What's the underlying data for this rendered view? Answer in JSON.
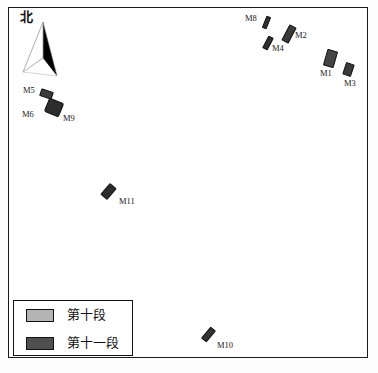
{
  "map": {
    "title": "段董土墓葬分布图",
    "north_label": "北",
    "north_icon": "north-arrow-icon",
    "frame_color": "#1a1a1a",
    "background_color": "#ffffff"
  },
  "legend": {
    "items": [
      {
        "label": "第十段",
        "color": "#b4b4b4",
        "phase": 10
      },
      {
        "label": "第十一段",
        "color": "#4f4f4f",
        "phase": 11
      }
    ]
  },
  "tombs": [
    {
      "id": "M8",
      "label": "M8",
      "color": "#2e2e2e",
      "x": 264,
      "y": 16,
      "w": 5,
      "h": 13,
      "rot": 22,
      "lx": 245,
      "ly": 14,
      "radius": 1
    },
    {
      "id": "M2",
      "label": "M2",
      "color": "#3a3a3a",
      "x": 285,
      "y": 25,
      "w": 8,
      "h": 18,
      "rot": 28,
      "lx": 295,
      "ly": 31,
      "radius": 1
    },
    {
      "id": "M4",
      "label": "M4",
      "color": "#2f2f2f",
      "x": 265,
      "y": 36,
      "w": 6,
      "h": 14,
      "rot": 28,
      "lx": 272,
      "ly": 44,
      "radius": 1
    },
    {
      "id": "M1",
      "label": "M1",
      "color": "#444444",
      "x": 325,
      "y": 50,
      "w": 11,
      "h": 17,
      "rot": 16,
      "lx": 320,
      "ly": 69,
      "radius": 1
    },
    {
      "id": "M3",
      "label": "M3",
      "color": "#3b3b3b",
      "x": 344,
      "y": 63,
      "w": 9,
      "h": 13,
      "rot": 18,
      "lx": 344,
      "ly": 79,
      "radius": 1
    },
    {
      "id": "M5",
      "label": "M5",
      "color": "#3c3c3c",
      "x": 40,
      "y": 90,
      "w": 13,
      "h": 8,
      "rot": 18,
      "lx": 23,
      "ly": 86,
      "radius": 1
    },
    {
      "id": "M9",
      "label": "M9",
      "color": "#2d2d2d",
      "x": 46,
      "y": 100,
      "w": 16,
      "h": 15,
      "rot": 22,
      "lx": 63,
      "ly": 114,
      "radius": 2
    },
    {
      "id": "M6",
      "label": "M6",
      "color": "#2d2d2d",
      "x": 46,
      "y": 100,
      "w": 0,
      "h": 0,
      "rot": 0,
      "lx": 22,
      "ly": 110,
      "radius": 0
    },
    {
      "id": "M11",
      "label": "M11",
      "color": "#2b2b2b",
      "x": 104,
      "y": 184,
      "w": 9,
      "h": 15,
      "rot": 40,
      "lx": 119,
      "ly": 197,
      "radius": 1
    },
    {
      "id": "M10",
      "label": "M10",
      "color": "#333333",
      "x": 205,
      "y": 327,
      "w": 7,
      "h": 15,
      "rot": 40,
      "lx": 217,
      "ly": 341,
      "radius": 1
    }
  ]
}
